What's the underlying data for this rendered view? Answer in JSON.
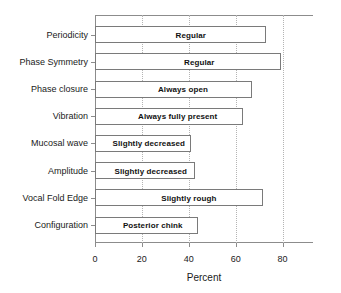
{
  "chart_data": {
    "type": "bar",
    "orientation": "horizontal",
    "title": "",
    "xlabel": "Percent",
    "ylabel": "",
    "xlim": [
      0,
      93
    ],
    "xticks": [
      0,
      20,
      40,
      60,
      80
    ],
    "xticklabels": [
      "0",
      "20",
      "40",
      "60",
      "80"
    ],
    "grid": "vertical-dotted",
    "legend": "none",
    "categories": [
      "Periodicity",
      "Phase Symmetry",
      "Phase closure",
      "Vibration",
      "Mucosal wave",
      "Amplitude",
      "Vocal Fold Edge",
      "Configuration"
    ],
    "values": [
      73,
      79.5,
      67,
      63,
      41,
      42.5,
      71.5,
      44
    ],
    "bar_labels": [
      "Regular",
      "Regular",
      "Always  open",
      "Always fully present",
      "Slightly decreased",
      "Slightly decreased",
      "Slightly rough",
      "Posterior chink"
    ],
    "colors": {
      "bar_fill": "#ffffff",
      "bar_edge": "#7a7a7a",
      "axis": "#8c8c8c",
      "grid": "#b4b4b4",
      "text": "#1a1a1a"
    }
  }
}
